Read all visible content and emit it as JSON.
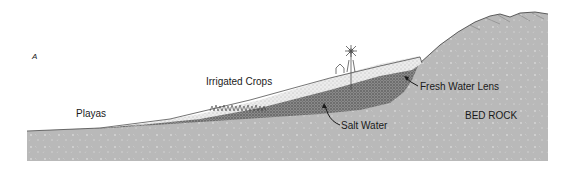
{
  "figure": {
    "panel_letter": "A",
    "labels": {
      "playas": "Playas",
      "irrigated_crops": "Irrigated Crops",
      "fresh_water_lens": "Fresh Water Lens",
      "salt_water": "Salt Water",
      "bed_rock": "BED ROCK"
    },
    "icons": [
      "windmill-icon",
      "farmhouse-icon",
      "crops-icon"
    ],
    "colors": {
      "bedrock": "#b9b9b9",
      "bedrock_speckle": "#d6d6d6",
      "fresh_water_sediment": "#e9e9e9",
      "salt_water_sediment": "#6f6f6f",
      "outline": "#3a3a3a",
      "text": "#1a1a1a"
    }
  }
}
